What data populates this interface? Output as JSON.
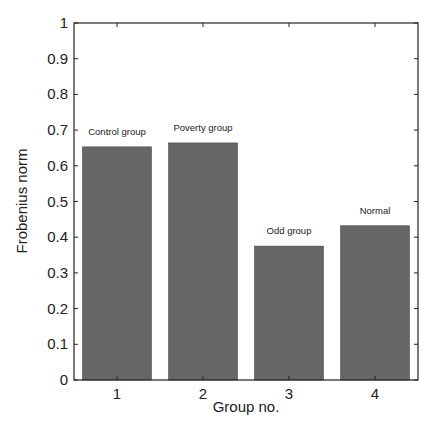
{
  "chart_data": {
    "type": "bar",
    "title": "",
    "xlabel": "Group no.",
    "ylabel": "Frobenius norm",
    "categories": [
      "1",
      "2",
      "3",
      "4"
    ],
    "values": [
      0.653,
      0.664,
      0.375,
      0.432
    ],
    "bar_labels": [
      "Control group",
      "Poverty group",
      "Odd group",
      "Normal"
    ],
    "ylim": [
      0,
      1
    ],
    "yticks": [
      "0",
      "0.1",
      "0.2",
      "0.3",
      "0.4",
      "0.5",
      "0.6",
      "0.7",
      "0.8",
      "0.9",
      "1"
    ],
    "grid": false,
    "legend": null,
    "bar_color": "#666666"
  }
}
